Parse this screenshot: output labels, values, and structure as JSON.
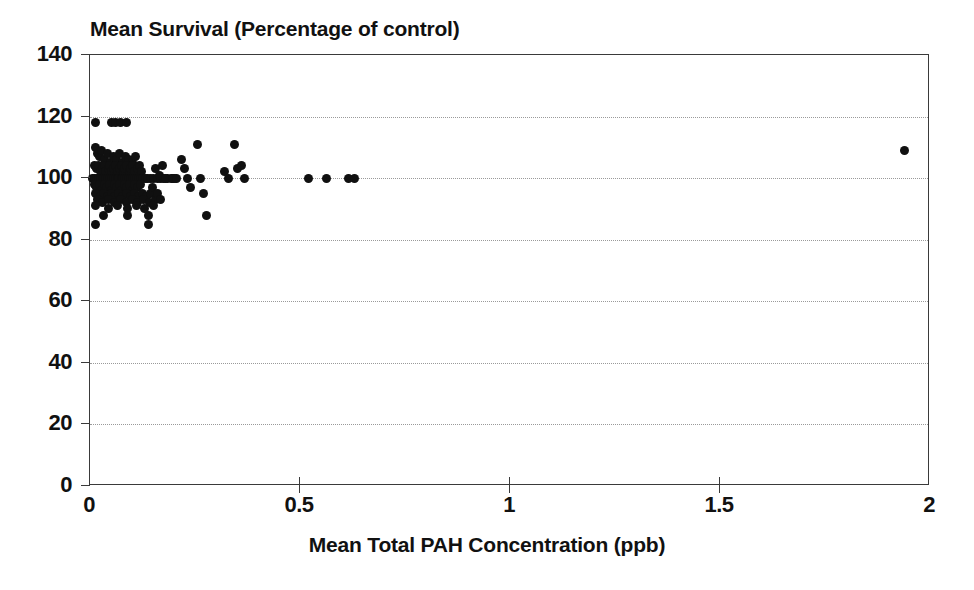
{
  "chart_data": {
    "type": "scatter",
    "title": "Mean Survival (Percentage of control)",
    "xlabel": "Mean Total PAH Concentration (ppb)",
    "ylabel": "",
    "xlim": [
      0,
      2
    ],
    "ylim": [
      0,
      140
    ],
    "xticks": [
      "0",
      "0.5",
      "1",
      "1.5",
      "2"
    ],
    "xtick_values": [
      0,
      0.5,
      1,
      1.5,
      2
    ],
    "yticks": [
      "0",
      "20",
      "40",
      "60",
      "80",
      "100",
      "120",
      "140"
    ],
    "ytick_values": [
      0,
      20,
      40,
      60,
      80,
      100,
      120,
      140
    ],
    "grid": "horizontal-dotted",
    "legend": "none",
    "marker_color": "#101010",
    "marker_shape": "circle",
    "points": [
      [
        0.012,
        118
      ],
      [
        0.052,
        118
      ],
      [
        0.06,
        118
      ],
      [
        0.072,
        118
      ],
      [
        0.086,
        118
      ],
      [
        0.012,
        110
      ],
      [
        0.018,
        108
      ],
      [
        0.022,
        107
      ],
      [
        0.028,
        109
      ],
      [
        0.035,
        106
      ],
      [
        0.042,
        108
      ],
      [
        0.048,
        105
      ],
      [
        0.055,
        107
      ],
      [
        0.062,
        106
      ],
      [
        0.07,
        108
      ],
      [
        0.078,
        105
      ],
      [
        0.085,
        107
      ],
      [
        0.092,
        106
      ],
      [
        0.1,
        105
      ],
      [
        0.108,
        107
      ],
      [
        0.01,
        104
      ],
      [
        0.016,
        103
      ],
      [
        0.021,
        104
      ],
      [
        0.026,
        102
      ],
      [
        0.03,
        103
      ],
      [
        0.034,
        104
      ],
      [
        0.038,
        102
      ],
      [
        0.043,
        103
      ],
      [
        0.047,
        104
      ],
      [
        0.051,
        102
      ],
      [
        0.056,
        103
      ],
      [
        0.06,
        104
      ],
      [
        0.065,
        102
      ],
      [
        0.07,
        103
      ],
      [
        0.074,
        104
      ],
      [
        0.079,
        102
      ],
      [
        0.083,
        103
      ],
      [
        0.088,
        104
      ],
      [
        0.093,
        102
      ],
      [
        0.097,
        103
      ],
      [
        0.102,
        104
      ],
      [
        0.107,
        102
      ],
      [
        0.112,
        103
      ],
      [
        0.117,
        104
      ],
      [
        0.122,
        102
      ],
      [
        0.006,
        100
      ],
      [
        0.011,
        100
      ],
      [
        0.015,
        100
      ],
      [
        0.02,
        100
      ],
      [
        0.024,
        100
      ],
      [
        0.029,
        100
      ],
      [
        0.033,
        100
      ],
      [
        0.038,
        100
      ],
      [
        0.042,
        100
      ],
      [
        0.047,
        100
      ],
      [
        0.051,
        100
      ],
      [
        0.056,
        100
      ],
      [
        0.06,
        100
      ],
      [
        0.065,
        100
      ],
      [
        0.069,
        100
      ],
      [
        0.074,
        100
      ],
      [
        0.078,
        100
      ],
      [
        0.083,
        100
      ],
      [
        0.087,
        100
      ],
      [
        0.092,
        100
      ],
      [
        0.097,
        100
      ],
      [
        0.101,
        100
      ],
      [
        0.106,
        100
      ],
      [
        0.11,
        100
      ],
      [
        0.115,
        100
      ],
      [
        0.12,
        100
      ],
      [
        0.126,
        100
      ],
      [
        0.132,
        100
      ],
      [
        0.138,
        100
      ],
      [
        0.145,
        100
      ],
      [
        0.152,
        100
      ],
      [
        0.16,
        100
      ],
      [
        0.168,
        100
      ],
      [
        0.176,
        100
      ],
      [
        0.185,
        100
      ],
      [
        0.193,
        100
      ],
      [
        0.201,
        100
      ],
      [
        0.01,
        98
      ],
      [
        0.016,
        97
      ],
      [
        0.022,
        98
      ],
      [
        0.028,
        96
      ],
      [
        0.034,
        98
      ],
      [
        0.04,
        97
      ],
      [
        0.046,
        98
      ],
      [
        0.052,
        96
      ],
      [
        0.058,
        98
      ],
      [
        0.064,
        97
      ],
      [
        0.07,
        98
      ],
      [
        0.076,
        96
      ],
      [
        0.082,
        98
      ],
      [
        0.088,
        97
      ],
      [
        0.094,
        98
      ],
      [
        0.1,
        96
      ],
      [
        0.106,
        98
      ],
      [
        0.113,
        97
      ],
      [
        0.12,
        98
      ],
      [
        0.014,
        95
      ],
      [
        0.024,
        94
      ],
      [
        0.032,
        95
      ],
      [
        0.041,
        94
      ],
      [
        0.05,
        95
      ],
      [
        0.059,
        94
      ],
      [
        0.068,
        95
      ],
      [
        0.077,
        94
      ],
      [
        0.086,
        95
      ],
      [
        0.096,
        94
      ],
      [
        0.105,
        95
      ],
      [
        0.115,
        94
      ],
      [
        0.125,
        95
      ],
      [
        0.135,
        94
      ],
      [
        0.145,
        95
      ],
      [
        0.018,
        93
      ],
      [
        0.03,
        92
      ],
      [
        0.044,
        93
      ],
      [
        0.058,
        92
      ],
      [
        0.072,
        93
      ],
      [
        0.086,
        92
      ],
      [
        0.1,
        93
      ],
      [
        0.114,
        92
      ],
      [
        0.128,
        93
      ],
      [
        0.142,
        92
      ],
      [
        0.155,
        93
      ],
      [
        0.012,
        91
      ],
      [
        0.045,
        90
      ],
      [
        0.065,
        91
      ],
      [
        0.09,
        90
      ],
      [
        0.11,
        91
      ],
      [
        0.13,
        90
      ],
      [
        0.15,
        91
      ],
      [
        0.032,
        88
      ],
      [
        0.09,
        88
      ],
      [
        0.14,
        88
      ],
      [
        0.012,
        85
      ],
      [
        0.14,
        85
      ],
      [
        0.155,
        103
      ],
      [
        0.165,
        101
      ],
      [
        0.172,
        104
      ],
      [
        0.18,
        100
      ],
      [
        0.148,
        97
      ],
      [
        0.16,
        95
      ],
      [
        0.168,
        93
      ],
      [
        0.196,
        100
      ],
      [
        0.205,
        100
      ],
      [
        0.218,
        106
      ],
      [
        0.226,
        103
      ],
      [
        0.232,
        100
      ],
      [
        0.24,
        97
      ],
      [
        0.255,
        111
      ],
      [
        0.262,
        100
      ],
      [
        0.27,
        95
      ],
      [
        0.278,
        88
      ],
      [
        0.32,
        102
      ],
      [
        0.33,
        100
      ],
      [
        0.345,
        111
      ],
      [
        0.352,
        103
      ],
      [
        0.36,
        104
      ],
      [
        0.368,
        100
      ],
      [
        0.52,
        100
      ],
      [
        0.562,
        100
      ],
      [
        0.615,
        100
      ],
      [
        0.63,
        100
      ],
      [
        1.94,
        109
      ]
    ]
  },
  "axes": {
    "y_tick_labels": [
      "140",
      "120",
      "100",
      "80",
      "60",
      "40",
      "20",
      "0"
    ],
    "x_tick_labels": [
      "0",
      "0.5",
      "1",
      "1.5",
      "2"
    ]
  }
}
